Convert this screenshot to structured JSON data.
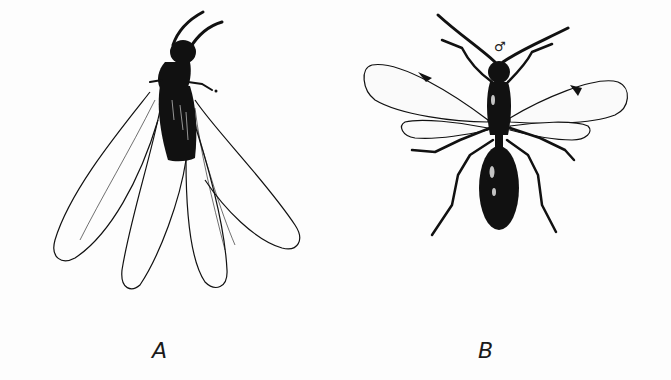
{
  "figure": {
    "panels": [
      {
        "id": "A",
        "label": "A",
        "subject": "winged insect with four elongated membranous wings spread below dark body"
      },
      {
        "id": "B",
        "label": "B",
        "subject": "winged wasp-like insect, dorsal view, male",
        "sex_symbol": "♂"
      }
    ],
    "colors": {
      "ink": "#111111",
      "background": "#fdfdfd"
    }
  }
}
